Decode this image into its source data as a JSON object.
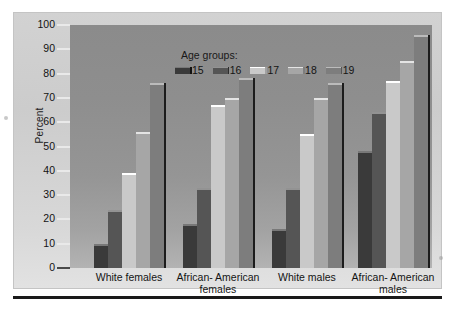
{
  "figure": {
    "background_color": "#ffffff",
    "panel_color": "#d2d2d2",
    "plot_color": "#919191"
  },
  "legend": {
    "title": "Age groups:",
    "items": [
      {
        "label": "15",
        "color": "#3a3a3a"
      },
      {
        "label": "16",
        "color": "#555555"
      },
      {
        "label": "17",
        "color": "#c9c9c9"
      },
      {
        "label": "18",
        "color": "#a6a6a6"
      },
      {
        "label": "19",
        "color": "#7d7d7d"
      }
    ]
  },
  "axis": {
    "ylabel": "Percent",
    "yticks": [
      "0",
      "10",
      "20",
      "30",
      "40",
      "50",
      "60",
      "70",
      "80",
      "90",
      "100"
    ]
  },
  "xlabels": [
    {
      "line1": "White females",
      "line2": ""
    },
    {
      "line1": "African- American",
      "line2": "females"
    },
    {
      "line1": "White males",
      "line2": ""
    },
    {
      "line1": "African- American",
      "line2": "males"
    }
  ],
  "chart_data": {
    "type": "bar",
    "title": "",
    "xlabel": "",
    "ylabel": "Percent",
    "ylim": [
      0,
      100
    ],
    "grid": false,
    "legend_position": "top-center",
    "legend_title": "Age groups:",
    "categories": [
      "White females",
      "African-American females",
      "White males",
      "African-American males"
    ],
    "series": [
      {
        "name": "15",
        "color": "#3a3a3a",
        "values": [
          10,
          18,
          16,
          48
        ]
      },
      {
        "name": "16",
        "color": "#555555",
        "values": [
          24,
          33,
          33,
          64
        ]
      },
      {
        "name": "17",
        "color": "#c9c9c9",
        "values": [
          39,
          67,
          55,
          77
        ]
      },
      {
        "name": "18",
        "color": "#a6a6a6",
        "values": [
          56,
          70,
          70,
          85
        ]
      },
      {
        "name": "19",
        "color": "#7d7d7d",
        "values": [
          76,
          78,
          76,
          96
        ]
      }
    ]
  }
}
